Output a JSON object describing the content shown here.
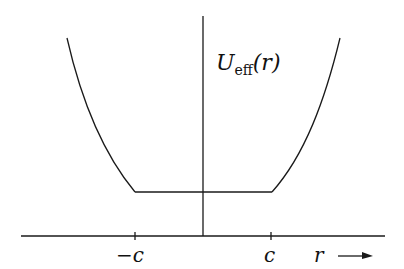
{
  "diagram": {
    "type": "potential-well-plot",
    "y_label": {
      "main": "U",
      "subscript": "eff",
      "arg": "(r)"
    },
    "x_axis": {
      "label": "r",
      "arrow": true,
      "ticks": [
        {
          "label": "−c",
          "position": "-c"
        },
        {
          "label": "c",
          "position": "c"
        }
      ]
    },
    "curve": {
      "description": "flat bottom between -c and c, rising steeply outside",
      "segments": [
        "left-rising-curve",
        "flat-bottom",
        "right-rising-curve"
      ]
    },
    "colors": {
      "stroke": "#1a1a1a",
      "background": "#ffffff"
    }
  }
}
